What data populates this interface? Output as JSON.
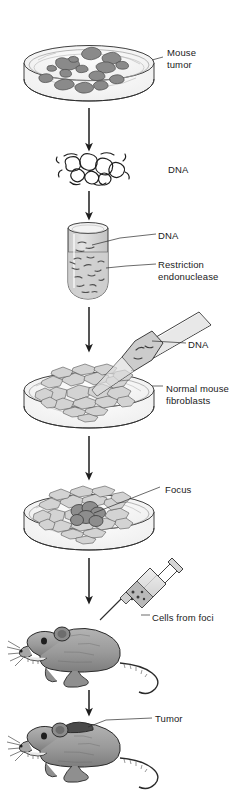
{
  "figure": {
    "background_color": "#ffffff",
    "width": 241,
    "height": 792
  },
  "palette": {
    "outline": "#2b2b2b",
    "text": "#1a1a1a",
    "tumor_colony_fill": "#8a8a8a",
    "tumor_colony_stroke": "#4a4a4a",
    "fibroblast_fill": "#d3d3d3",
    "fibroblast_stroke": "#555555",
    "focus_fill": "#8d8d8d",
    "focus_stroke": "#3c3c3c",
    "dish_glass": "#f4f4f4",
    "tube_liquid": "#d8d8d8",
    "mouse_body": "#9a9a9a",
    "mouse_dark": "#3a3a3a",
    "syringe_fill": "#dcdcdc",
    "arrow": "#1d1d1d"
  },
  "steps": [
    {
      "id": "step-mouse-tumor",
      "order": 1,
      "icon": "petri-dish-icon",
      "label": "Mouse\ntumor",
      "label_line1": "Mouse",
      "label_line2": "tumor",
      "description": "Petri dish containing mouse tumor tissue colonies"
    },
    {
      "id": "step-dna",
      "order": 2,
      "icon": "dna-tangle-icon",
      "label": "DNA",
      "description": "Purified tangled genomic DNA extracted from tumor"
    },
    {
      "id": "step-restriction-digest",
      "order": 3,
      "icon": "test-tube-icon",
      "labels": [
        {
          "id": "dna-in-tube",
          "text": "DNA"
        },
        {
          "id": "restriction-endonuclease",
          "text": "Restriction\nendonuclease",
          "line1": "Restriction",
          "line2": "endonuclease"
        }
      ],
      "description": "Test tube where DNA is cut by restriction endonuclease"
    },
    {
      "id": "step-transfection",
      "order": 4,
      "icon": "pipette-icon",
      "labels": [
        {
          "id": "dna-in-pipette",
          "text": "DNA"
        },
        {
          "id": "normal-mouse-fibroblasts",
          "text": "Normal mouse\nfibroblasts",
          "line1": "Normal mouse",
          "line2": "fibroblasts"
        }
      ],
      "description": "DNA pipetted onto a monolayer of normal mouse fibroblasts"
    },
    {
      "id": "step-focus",
      "order": 5,
      "icon": "petri-dish-icon",
      "label": "Focus",
      "description": "Transformed focus of dark piled-up cells within fibroblast monolayer"
    },
    {
      "id": "step-injection",
      "order": 6,
      "icon": "syringe-icon",
      "label": "Cells from foci",
      "description": "Cells harvested from foci injected into a mouse"
    },
    {
      "id": "step-tumor-formation",
      "order": 7,
      "icon": "mouse-icon",
      "label": "Tumor",
      "description": "Injected mouse develops a tumor"
    }
  ],
  "labels": {
    "mouse_tumor_line1": "Mouse",
    "mouse_tumor_line2": "tumor",
    "dna_tangle": "DNA",
    "dna_tube": "DNA",
    "restriction_line1": "Restriction",
    "restriction_line2": "endonuclease",
    "dna_pipette": "DNA",
    "fibroblasts_line1": "Normal mouse",
    "fibroblasts_line2": "fibroblasts",
    "focus": "Focus",
    "cells_from_foci": "Cells from foci",
    "tumor": "Tumor"
  },
  "arrows": [
    {
      "id": "arrow-1",
      "from": "step-mouse-tumor",
      "to": "step-dna",
      "direction": "down"
    },
    {
      "id": "arrow-2",
      "from": "step-dna",
      "to": "step-restriction-digest",
      "direction": "down"
    },
    {
      "id": "arrow-3",
      "from": "step-restriction-digest",
      "to": "step-transfection",
      "direction": "down"
    },
    {
      "id": "arrow-4",
      "from": "step-transfection",
      "to": "step-focus",
      "direction": "down"
    },
    {
      "id": "arrow-5",
      "from": "step-focus",
      "to": "step-injection",
      "direction": "down"
    },
    {
      "id": "arrow-6",
      "from": "step-injection",
      "to": "step-tumor-formation",
      "direction": "down"
    }
  ]
}
